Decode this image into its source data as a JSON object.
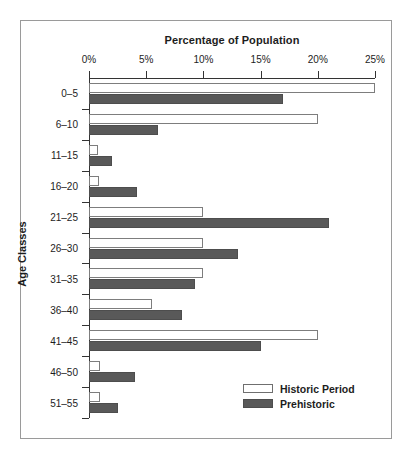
{
  "chart_data": {
    "type": "bar",
    "orientation": "horizontal",
    "title": "Percentage of Population",
    "xlabel": "Percentage of Population",
    "ylabel": "Age Classes",
    "categories": [
      "0–5",
      "6–10",
      "11–15",
      "16–20",
      "21–25",
      "26–30",
      "31–35",
      "36–40",
      "41–45",
      "46–50",
      "51–55"
    ],
    "series": [
      {
        "name": "Historic Period",
        "color": "#ffffff",
        "edge_color": "#7d7d7d",
        "values": [
          25.0,
          20.0,
          0.8,
          0.9,
          10.0,
          10.0,
          10.0,
          5.5,
          20.0,
          1.0,
          1.0
        ]
      },
      {
        "name": "Prehistoric",
        "color": "#595959",
        "edge_color": "#4d4d4d",
        "values": [
          17.0,
          6.0,
          2.0,
          4.2,
          21.0,
          13.0,
          9.3,
          8.1,
          15.0,
          4.0,
          2.5
        ]
      }
    ],
    "xlim": [
      0,
      25
    ],
    "xticks": [
      0,
      5,
      10,
      15,
      20,
      25
    ],
    "xtick_labels": [
      "0%",
      "5%",
      "10%",
      "15%",
      "20%",
      "25%"
    ],
    "grid": false,
    "legend_position": "bottom-right",
    "legend_entries": [
      "Historic Period",
      "Prehistoric"
    ]
  },
  "figure": {
    "background": "#ffffff",
    "frame_color": "#9a9a9a",
    "axis_color": "#333333",
    "text_color": "#1d1d1d"
  }
}
